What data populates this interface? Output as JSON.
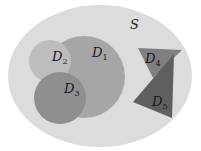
{
  "diagram": {
    "universe": {
      "label": "S",
      "shape": "ellipse",
      "cx": 100,
      "cy": 76,
      "rx": 92,
      "ry": 71,
      "color": "#dcdcdc",
      "label_pos": [
        130,
        29
      ]
    },
    "regions": [
      {
        "id": "D1",
        "letter": "D",
        "subscript": "1",
        "shape": "circle",
        "cx": 84,
        "cy": 77,
        "r": 41,
        "color": "#a6a6a6",
        "label_pos": [
          92,
          57
        ]
      },
      {
        "id": "D2",
        "letter": "D",
        "subscript": "2",
        "shape": "circle",
        "cx": 50,
        "cy": 61,
        "r": 21,
        "color": "#bdbdbd",
        "label_pos": [
          52,
          61
        ]
      },
      {
        "id": "D3",
        "letter": "D",
        "subscript": "3",
        "shape": "circle",
        "cx": 60,
        "cy": 98,
        "r": 26,
        "color": "#8f8f8f",
        "label_pos": [
          64,
          93
        ]
      },
      {
        "id": "D4",
        "letter": "D",
        "subscript": "4",
        "shape": "triangle",
        "points": "138,48 182,50 153,78",
        "color": "#808080",
        "label_pos": [
          145,
          63
        ]
      },
      {
        "id": "D5",
        "letter": "D",
        "subscript": "5",
        "shape": "triangle",
        "points": "174,54 133,102 172,118",
        "color": "#5f5f5f",
        "label_pos": [
          152,
          106
        ]
      }
    ]
  }
}
